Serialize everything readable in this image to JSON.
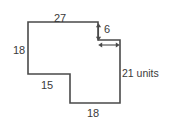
{
  "figure": {
    "name": "composite-rectilinear-polygon-with-dimension-labels",
    "shape_type": "rectilinear-polygon",
    "stroke_color": "#4a4a4a",
    "label_color": "#3a3a3a",
    "background_color": "#ffffff",
    "labels": {
      "top": "27",
      "left": "18",
      "notch_height": "6",
      "right": "21 units",
      "middle_horizontal": "15",
      "bottom": "18"
    },
    "units_note": "units",
    "outline_points": "28,22 98,22 98,40 120,40 120,103 70,103 70,74 28,74",
    "notch_vertical_arrow": {
      "x": 98,
      "y_top": 24,
      "y_bottom": 40,
      "value": "6"
    },
    "notch_horizontal_arrow": {
      "y": 45,
      "x_left": 99,
      "x_right": 119
    }
  }
}
